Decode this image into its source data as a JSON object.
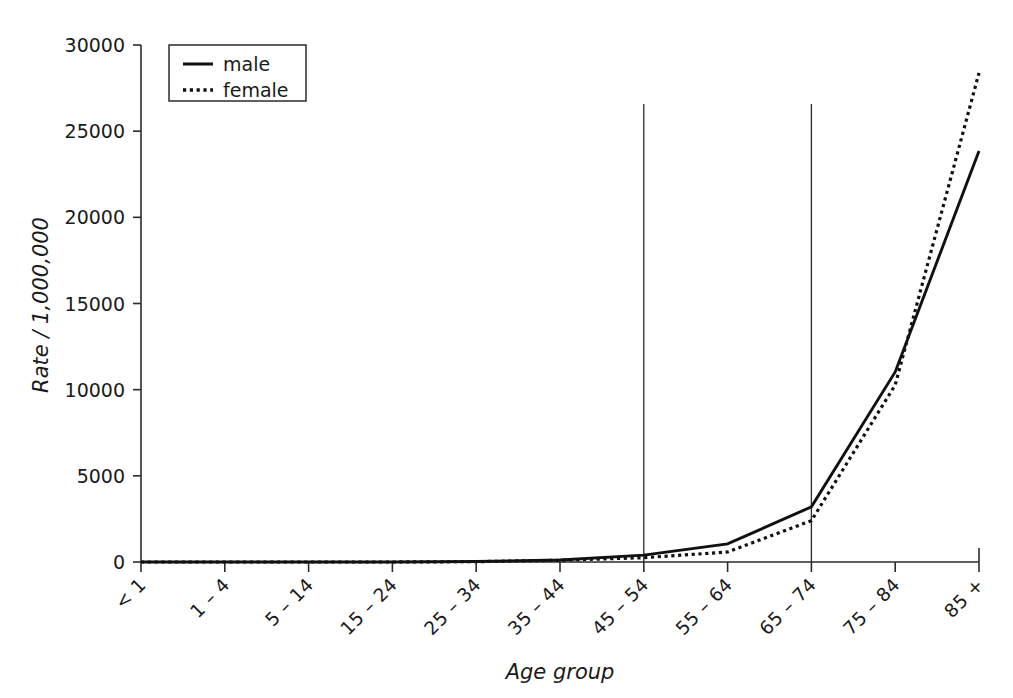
{
  "chart_data": {
    "type": "line",
    "title": "",
    "xlabel": "Age group",
    "ylabel": "Rate / 1,000,000",
    "categories": [
      "< 1",
      "1 – 4",
      "5 – 14",
      "15 – 24",
      "25 – 34",
      "35 – 44",
      "45 – 54",
      "55 – 64",
      "65 – 74",
      "75 – 84",
      "85 +"
    ],
    "series": [
      {
        "name": "male",
        "style": "solid",
        "values": [
          0,
          0,
          0,
          0,
          30,
          120,
          400,
          1050,
          3200,
          11030,
          23850
        ]
      },
      {
        "name": "female",
        "style": "dotted",
        "values": [
          0,
          0,
          0,
          0,
          20,
          100,
          250,
          580,
          2400,
          10270,
          28380
        ]
      }
    ],
    "ylim": [
      0,
      30000
    ],
    "yticks": [
      0,
      5000,
      10000,
      15000,
      20000,
      25000,
      30000
    ],
    "ytick_labels": [
      "0",
      "5000",
      "10000",
      "15000",
      "20000",
      "25000",
      "30000"
    ],
    "grid": false,
    "reference_lines": [
      {
        "category": "45 – 54",
        "orientation": "vertical"
      },
      {
        "category": "65 – 74",
        "orientation": "vertical"
      }
    ],
    "legend": {
      "position": "top-left",
      "entries": [
        {
          "label": "male",
          "style": "solid"
        },
        {
          "label": "female",
          "style": "dotted"
        }
      ]
    },
    "xtick_label_rotation": -45,
    "colors": {
      "line": "#111111",
      "axis": "#2b2b2b",
      "background": "#ffffff"
    }
  }
}
